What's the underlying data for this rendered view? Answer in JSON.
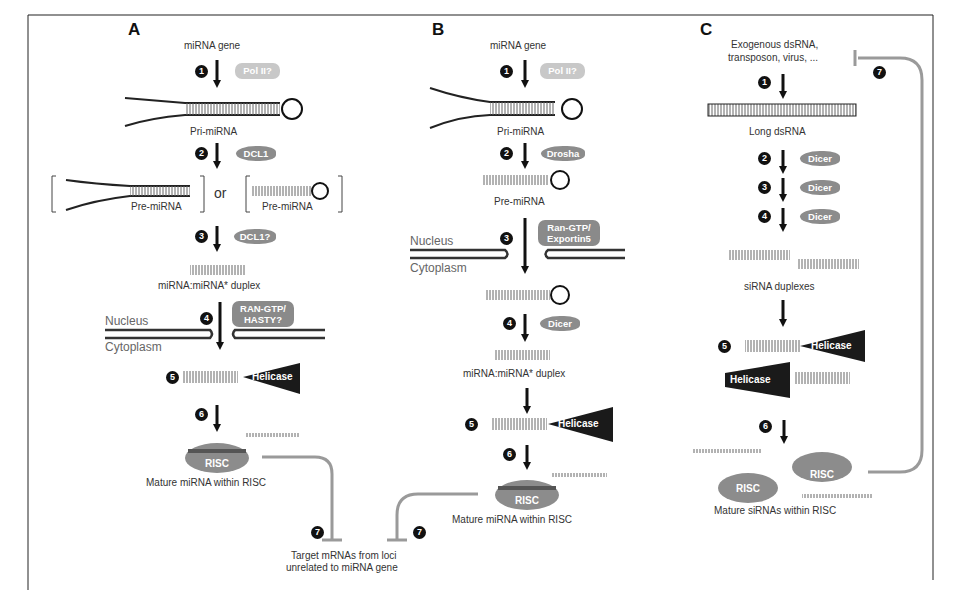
{
  "figure": {
    "frame": {
      "left": 28,
      "top": 15,
      "right": 933,
      "bottom": 590
    },
    "colors": {
      "dark": "#111111",
      "protein_gray": "#8c8c8c",
      "light_gray": "#c8c8c8",
      "inhibit_line": "#9a9a9a"
    }
  },
  "panel_a": {
    "letter": "A",
    "start_label": "miRNA gene",
    "steps": [
      {
        "num": "1",
        "enzyme": "Pol II?"
      },
      {
        "num": "2",
        "enzyme": "DCL1"
      },
      {
        "num": "3",
        "enzyme": "DCL1?"
      },
      {
        "num": "4",
        "enzyme_line1": "RAN-GTP/",
        "enzyme_line2": "HASTY?"
      },
      {
        "num": "5",
        "enzyme": "Helicase"
      },
      {
        "num": "6"
      },
      {
        "num": "7"
      }
    ],
    "pri_label": "Pri-miRNA",
    "pre_label_left": "Pre-miRNA",
    "or_label": "or",
    "pre_label_right": "Pre-miRNA",
    "duplex_label": "miRNA:miRNA* duplex",
    "nucleus_label": "Nucleus",
    "cytoplasm_label": "Cytoplasm",
    "risc_label": "RISC",
    "mature_label": "Mature miRNA within RISC"
  },
  "panel_b": {
    "letter": "B",
    "start_label": "miRNA gene",
    "steps": [
      {
        "num": "1",
        "enzyme": "Pol II?"
      },
      {
        "num": "2",
        "enzyme": "Drosha"
      },
      {
        "num": "3",
        "enzyme_line1": "Ran-GTP/",
        "enzyme_line2": "Exportin5"
      },
      {
        "num": "4",
        "enzyme": "Dicer"
      },
      {
        "num": "5",
        "enzyme": "Helicase"
      },
      {
        "num": "6"
      },
      {
        "num": "7"
      }
    ],
    "pri_label": "Pri-miRNA",
    "pre_label": "Pre-miRNA",
    "nucleus_label": "Nucleus",
    "cytoplasm_label": "Cytoplasm",
    "duplex_label": "miRNA:miRNA* duplex",
    "risc_label": "RISC",
    "mature_label": "Mature miRNA within RISC"
  },
  "target": {
    "line1": "Target mRNAs from loci",
    "line2": "unrelated to miRNA gene"
  },
  "panel_c": {
    "letter": "C",
    "start_line1": "Exogenous dsRNA,",
    "start_line2": "transposon, virus, ...",
    "steps": [
      {
        "num": "1"
      },
      {
        "num": "2",
        "enzyme": "Dicer"
      },
      {
        "num": "3",
        "enzyme": "Dicer"
      },
      {
        "num": "4",
        "enzyme": "Dicer"
      },
      {
        "num": "5",
        "enzyme": "Helicase",
        "enzyme2": "Helicase"
      },
      {
        "num": "6"
      },
      {
        "num": "7"
      }
    ],
    "long_label": "Long dsRNA",
    "sirna_label": "siRNA duplexes",
    "risc_label": "RISC",
    "risc_label2": "RISC",
    "mature_label": "Mature siRNAs within RISC"
  }
}
